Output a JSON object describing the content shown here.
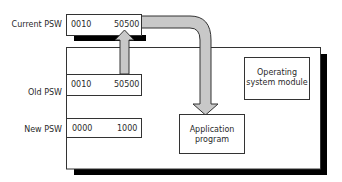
{
  "diagram": {
    "registers": {
      "current_psw": {
        "label": "Current PSW",
        "left_value": "0010",
        "right_value": "50500"
      },
      "old_psw": {
        "label": "Old PSW",
        "left_value": "0010",
        "right_value": "50500"
      },
      "new_psw": {
        "label": "New PSW",
        "left_value": "0000",
        "right_value": "1000"
      }
    },
    "modules": {
      "operating_system": {
        "line1": "Operating",
        "line2": "system module"
      },
      "application": {
        "line1": "Application",
        "line2": "program"
      }
    },
    "arrows": [
      {
        "from": "current_psw",
        "to": "old_psw",
        "meaning": "save current PSW"
      },
      {
        "from": "current_psw",
        "to": "application",
        "meaning": "resume application program"
      }
    ],
    "colors": {
      "arrow_fill": "#c8c8c8",
      "stroke": "#333333",
      "shadow": "#000000",
      "background": "#ffffff"
    }
  }
}
